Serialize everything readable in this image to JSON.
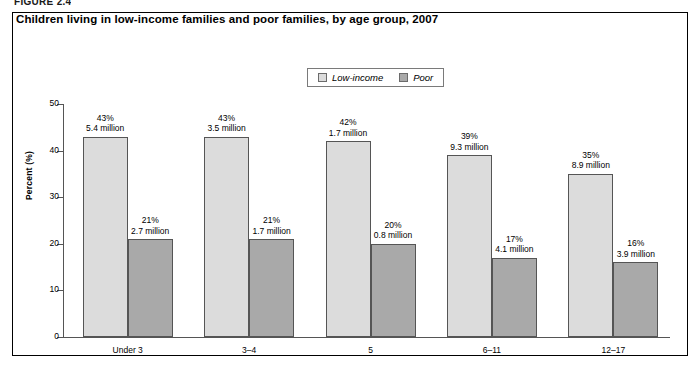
{
  "figure_label": "FIGURE 2.4",
  "chart_title": "Children living in low-income families and poor families, by age group, 2007",
  "legend": {
    "items": [
      {
        "label": "Low-income",
        "color": "#dcdcdc"
      },
      {
        "label": "Poor",
        "color": "#a9a9a9"
      }
    ]
  },
  "axis": {
    "y_title": "Percent (%)",
    "y_ticks": [
      "0",
      "10",
      "20",
      "30",
      "40",
      "50"
    ]
  },
  "chart_data": {
    "type": "bar",
    "title": "Children living in low-income families and poor families, by age group, 2007",
    "xlabel": "",
    "ylabel": "Percent (%)",
    "ylim": [
      0,
      50
    ],
    "ytick_step": 10,
    "grid": false,
    "legend_position": "top-center",
    "categories": [
      "Under 3",
      "3–4",
      "5",
      "6–11",
      "12–17"
    ],
    "series": [
      {
        "name": "Low-income",
        "color": "#dcdcdc",
        "values": [
          43,
          43,
          42,
          39,
          35
        ],
        "data_labels": [
          "43%",
          "43%",
          "42%",
          "39%",
          "35%"
        ],
        "counts": [
          "5.4 million",
          "3.5 million",
          "1.7 million",
          "9.3 million",
          "8.9 million"
        ]
      },
      {
        "name": "Poor",
        "color": "#a9a9a9",
        "values": [
          21,
          21,
          20,
          17,
          16
        ],
        "data_labels": [
          "21%",
          "21%",
          "20%",
          "17%",
          "16%"
        ],
        "counts": [
          "2.7 million",
          "1.7 million",
          "0.8 million",
          "4.1 million",
          "3.9 million"
        ]
      }
    ]
  }
}
